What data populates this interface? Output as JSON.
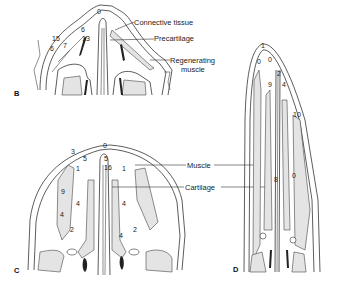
{
  "panels": {
    "B": {
      "letter": "B",
      "labels": [
        "Connective tissue",
        "Precartilage",
        "Regenerating",
        "muscle"
      ],
      "numbers": [
        "0",
        "6",
        "13",
        "15",
        "6",
        "7"
      ]
    },
    "C": {
      "letter": "C",
      "labels": [
        "Muscle",
        "Cartilage"
      ],
      "numbers": [
        "3",
        "5",
        "0",
        "5",
        "16",
        "1",
        "1",
        "9",
        "4",
        "4",
        "4",
        "2",
        "2",
        "4"
      ]
    },
    "D": {
      "letter": "D",
      "numbers": [
        "1",
        "0",
        "0",
        "2",
        "9",
        "4",
        "10",
        "8",
        "0"
      ]
    }
  }
}
